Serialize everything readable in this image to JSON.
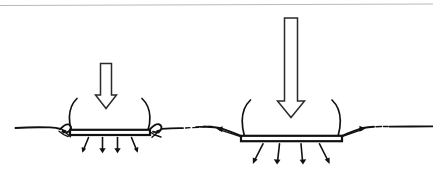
{
  "figure": {
    "title": "Bearing capacity of narrow and wide footings",
    "width_px": 433,
    "height_px": 179,
    "background_color": "#ffffff",
    "ink_color": "#111111",
    "frame_rule_color": "#b9b9b9"
  },
  "panels": [
    {
      "id": "narrow-footing",
      "name": "Narrow footing panel",
      "load_arrow": {
        "name": "applied-load-arrow-small",
        "relative_magnitude": "small",
        "shaft_length_px": 34,
        "shaft_width_px": 11,
        "head_width_px": 21
      },
      "footing": {
        "name": "footing-slab-narrow",
        "width_px": 80,
        "thickness_px": 5,
        "relative_width": "narrow",
        "settlement": "small"
      },
      "contact_pressure_arrows": 4,
      "heave_arrows": 2,
      "shear_curves": 2
    },
    {
      "id": "wide-footing",
      "name": "Wide footing panel",
      "load_arrow": {
        "name": "applied-load-arrow-large",
        "relative_magnitude": "large",
        "shaft_length_px": 88,
        "shaft_width_px": 13,
        "head_width_px": 27
      },
      "footing": {
        "name": "footing-slab-wide",
        "width_px": 101,
        "thickness_px": 5,
        "relative_width": "wide",
        "settlement": "large"
      },
      "contact_pressure_arrows": 4,
      "heave_arrows": 2,
      "shear_curves": 2
    }
  ]
}
